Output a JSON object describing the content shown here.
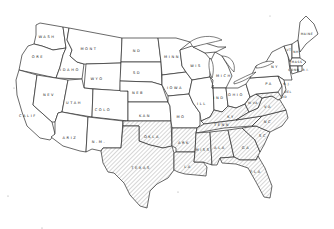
{
  "map": {
    "title": "",
    "description": "Outline map of the contiguous United States with abbreviated state labels; southeastern states are shaded with diagonal hatching.",
    "colors": {
      "background": "#ffffff",
      "outline": "#2a2a2a",
      "hatch": "#8a8a8a",
      "text": "#1a1a1a"
    },
    "legend": [],
    "states": {
      "wash": "WASH",
      "ore": "ORE",
      "calif": "CALIF",
      "idaho": "IDAHO",
      "nev": "NEV",
      "mont": "MONT",
      "wyo": "WYO",
      "utah": "UTAH",
      "ariz": "ARIZ",
      "colo": "COLO",
      "nm": "N.M.",
      "nd": "ND",
      "sd": "SD",
      "neb": "NEB",
      "kan": "KAN",
      "okla": "OKLA",
      "texas": "TEXAS",
      "minn": "MINN",
      "iowa": "IOWA",
      "mo": "MO",
      "ark": "ARK",
      "la": "LA",
      "wis": "WIS",
      "ill": "ILL",
      "mich": "MICH",
      "ind": "IND",
      "ohio": "OHIO",
      "ky": "KY",
      "tenn": "TENN",
      "miss": "MISS",
      "ala": "ALA",
      "ga": "GA",
      "fla": "FLA",
      "sc": "SC",
      "nc": "NC",
      "va": "VA",
      "wva": "W.VA",
      "pa": "PA",
      "ny": "NY",
      "maine": "MAINE",
      "vt": "VT",
      "nh": "NH",
      "mass": "MASS",
      "ri": "R.I.",
      "conn": "CONN",
      "nj": "N.J.",
      "del": "DEL",
      "md": "MD"
    },
    "shaded_states": [
      "TEXAS",
      "OKLA",
      "ARK",
      "LA",
      "MISS",
      "ALA",
      "GA",
      "FLA",
      "SC",
      "NC",
      "TENN",
      "KY",
      "VA",
      "W.VA",
      "MD",
      "DEL"
    ]
  }
}
